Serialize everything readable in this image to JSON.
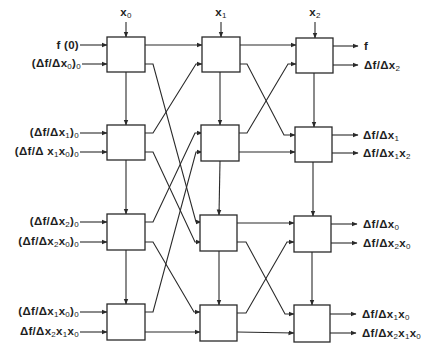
{
  "diagram": {
    "type": "interpolation-network-block-diagram",
    "columns": [
      {
        "variable": {
          "base": "x",
          "sub": "1"
        },
        "display": "x0"
      },
      {
        "variable": {
          "base": "x",
          "sub": "1"
        },
        "display": "x1"
      },
      {
        "variable": {
          "base": "x",
          "sub": "2"
        },
        "display": "x2"
      }
    ],
    "top_inputs": [
      {
        "base": "x",
        "sub": "0"
      },
      {
        "base": "x",
        "sub": "1"
      },
      {
        "base": "x",
        "sub": "2"
      }
    ],
    "left_inputs": [
      {
        "pre": "f (0)",
        "sub_parts": []
      },
      {
        "pre": "(Δf/Δx",
        "parts": [
          [
            "x",
            "0"
          ]
        ],
        "post": ")",
        "tail": "0"
      },
      {
        "pre": "(Δf/Δx",
        "parts": [
          [
            "x",
            "1"
          ]
        ],
        "post": ")",
        "tail": "0"
      },
      {
        "pre": "(Δf/Δ",
        "parts": [
          [
            "x",
            "1"
          ],
          [
            "x",
            "0"
          ]
        ],
        "post": ")",
        "tail": "0"
      },
      {
        "pre": "(Δf/Δx",
        "parts": [
          [
            "x",
            "2"
          ]
        ],
        "post": ")",
        "tail": "0"
      },
      {
        "pre": "(Δf/Δ",
        "parts": [
          [
            "x",
            "2"
          ],
          [
            "x",
            "0"
          ]
        ],
        "post": ")",
        "tail": "0"
      },
      {
        "pre": "(Δf/Δ",
        "parts": [
          [
            "x",
            "1"
          ],
          [
            "x",
            "0"
          ]
        ],
        "post": ")",
        "tail": "0"
      },
      {
        "pre": "Δf/Δ",
        "parts": [
          [
            "x",
            "2"
          ],
          [
            "x",
            "1"
          ],
          [
            "x",
            "0"
          ]
        ],
        "post": "",
        "tail": ""
      }
    ],
    "labels": {
      "top": [
        "x",
        "x",
        "x"
      ],
      "top_sub": [
        "0",
        "1",
        "2"
      ],
      "in_text": [
        "f (0)",
        "(Δf/Δx",
        "(Δf/Δx",
        "(Δf/Δ x",
        "(Δf/Δx",
        "(Δf/Δx",
        "(Δf/Δx",
        "Δf/Δx"
      ],
      "in_mid": [
        "",
        "0",
        "1",
        "1",
        "2",
        "2",
        "1",
        "2"
      ],
      "in_mid2": [
        "",
        "",
        "",
        "x",
        "",
        "x",
        "x",
        "x"
      ],
      "in_mid2_sub": [
        "",
        "",
        "",
        "0",
        "",
        "0",
        "0",
        "1"
      ],
      "in_mid3": [
        "",
        "",
        "",
        "",
        "",
        "",
        "",
        "x"
      ],
      "in_mid3_sub": [
        "",
        "",
        "",
        "",
        "",
        "",
        "",
        "0"
      ],
      "in_close": [
        "",
        ")",
        ")",
        ")",
        ")",
        ")",
        ")",
        ""
      ],
      "in_tail": [
        "",
        "0",
        "0",
        "0",
        "0",
        "0",
        "0",
        ""
      ],
      "out_text": [
        "f",
        "Δf/Δx",
        "Δf/Δx",
        "Δf/Δx",
        "Δf/Δx",
        "Δf/Δx",
        "Δf/Δx",
        "Δf/Δx"
      ],
      "out_sub1": [
        "",
        "2",
        "1",
        "1",
        "0",
        "2",
        "1",
        "2"
      ],
      "out_x2": [
        "",
        "",
        "",
        "x",
        "",
        "x",
        "x",
        "x"
      ],
      "out_sub2": [
        "",
        "",
        "",
        "2",
        "",
        "0",
        "0",
        "1"
      ],
      "out_x3": [
        "",
        "",
        "",
        "",
        "",
        "",
        "",
        "x"
      ],
      "out_sub3": [
        "",
        "",
        "",
        "",
        "",
        "",
        "",
        "0"
      ]
    },
    "outputs": [
      "f",
      "Δf/Δx2",
      "Δf/Δx1",
      "Δf/Δx1x2",
      "Δf/Δx0",
      "Δf/Δx2x0",
      "Δf/Δx1x0",
      "Δf/Δx2x1x0"
    ],
    "inputs": [
      "f (0)",
      "(Δf/Δx0)0",
      "(Δf/Δx1)0",
      "(Δf/Δx1x0)0",
      "(Δf/Δx2)0",
      "(Δf/Δx2x0)0",
      "(Δf/Δx1x0)0",
      "Δf/Δx2x1x0"
    ],
    "grid": {
      "columns": 3,
      "rows": 4
    },
    "colors": {
      "line": "#2a2a2a",
      "background": "#ffffff"
    }
  }
}
